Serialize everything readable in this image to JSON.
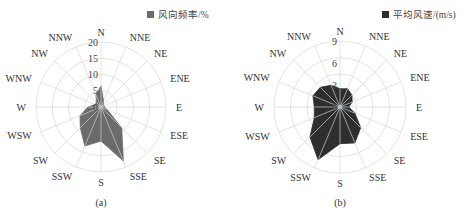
{
  "chart_data": [
    {
      "type": "radar",
      "panel": "(a)",
      "legend": "风向频率/%",
      "fill_color": "#6b6b6b",
      "directions": [
        "N",
        "NNE",
        "NE",
        "ENE",
        "E",
        "ESE",
        "SE",
        "SSE",
        "S",
        "SSW",
        "SW",
        "WSW",
        "W",
        "WNW",
        "NW",
        "NNW"
      ],
      "values": [
        6.5,
        2,
        1,
        1,
        1,
        2,
        9,
        18,
        10.5,
        13,
        9,
        7,
        4,
        2,
        2,
        4
      ],
      "radial_ticks": [
        0,
        5,
        10,
        15,
        20
      ],
      "rlim": [
        0,
        20
      ],
      "grid": true,
      "legend_position": "top-right"
    },
    {
      "type": "radar",
      "panel": "(b)",
      "legend": "平均风速/(m/s)",
      "fill_color": "#2e2e2e",
      "directions": [
        "N",
        "NNE",
        "NE",
        "ENE",
        "E",
        "ESE",
        "SE",
        "SSE",
        "S",
        "SSW",
        "SW",
        "WSW",
        "W",
        "WNW",
        "NW",
        "NNW"
      ],
      "values": [
        2.5,
        2.7,
        2.3,
        1.8,
        1.2,
        2.2,
        4,
        5.3,
        5,
        7.8,
        5.8,
        3.8,
        3.5,
        4,
        3.8,
        3.2
      ],
      "radial_ticks": [
        0,
        3,
        6,
        9
      ],
      "rlim": [
        0,
        9
      ],
      "grid": true,
      "legend_position": "top-right"
    }
  ],
  "captions": {
    "a": "(a)",
    "b": "(b)"
  }
}
